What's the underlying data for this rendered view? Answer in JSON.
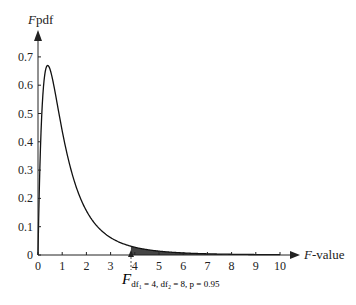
{
  "chart_data": {
    "type": "line",
    "title": "",
    "xlabel": "F-value",
    "ylabel": "Fpdf",
    "xlabel_italic_part": "F",
    "xlabel_rest": "-value",
    "ylabel_italic_part": "F",
    "ylabel_rest": "pdf",
    "xlim": [
      0,
      10
    ],
    "ylim": [
      0,
      0.7
    ],
    "x_ticks": [
      0,
      1,
      2,
      3,
      4,
      5,
      6,
      7,
      8,
      9,
      10
    ],
    "y_ticks": [
      0,
      0.1,
      0.2,
      0.3,
      0.4,
      0.5,
      0.6,
      0.7
    ],
    "x_tick_labels": [
      "0",
      "1",
      "2",
      "3",
      "4",
      "5",
      "6",
      "7",
      "8",
      "9",
      "10"
    ],
    "y_tick_labels": [
      "0",
      "0.1",
      "0.2",
      "0.3",
      "0.4",
      "0.5",
      "0.6",
      "0.7"
    ],
    "grid": false,
    "legend": null,
    "series": [
      {
        "name": "F distribution pdf (df1=4, df2=8)",
        "df1": 4,
        "df2": 8,
        "x": [
          0,
          0.1,
          0.2,
          0.3,
          0.4,
          0.5,
          0.6,
          0.8,
          1.0,
          1.25,
          1.5,
          2.0,
          2.5,
          3.0,
          3.5,
          3.84,
          4.0,
          5.0,
          6.0,
          7.0,
          8.0,
          9.0,
          10.0
        ],
        "y": [
          0,
          0.46,
          0.61,
          0.66,
          0.67,
          0.66,
          0.64,
          0.58,
          0.5,
          0.41,
          0.33,
          0.21,
          0.13,
          0.08,
          0.05,
          0.04,
          0.034,
          0.017,
          0.009,
          0.005,
          0.003,
          0.002,
          0.001
        ]
      }
    ],
    "shaded_region": {
      "from": 3.84,
      "to": 10,
      "meaning": "upper 5% tail"
    },
    "annotations": [
      {
        "text_main": "F",
        "text_subscript": "df₁ = 4, df₂ = 8, p = 0.95",
        "x": 3.84,
        "marker": "upward arrow with dashed line below x-axis"
      }
    ],
    "peak": {
      "x": 0.45,
      "y": 0.67
    }
  }
}
